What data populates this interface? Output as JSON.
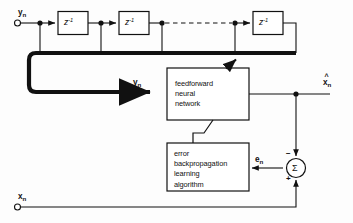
{
  "figure": {
    "type": "block-diagram",
    "background_color": "#fdfdfd",
    "line_color": "#111111"
  },
  "inputs": [
    {
      "id": "input-yn",
      "label": "y",
      "subscript": "n",
      "terminal": "open-circle",
      "position": "top-left"
    },
    {
      "id": "input-xn",
      "label": "x",
      "subscript": "n",
      "terminal": "open-circle",
      "position": "bottom-left"
    }
  ],
  "delay_line": {
    "name": "tapped-delay-line",
    "block_label": "z",
    "block_exponent": "-1",
    "block_count_shown": 3,
    "continuation": "dashed",
    "tap_count": 4
  },
  "bus": {
    "name": "delay-tap-bus",
    "style": "thick",
    "signal_label": "y",
    "signal_subscript": "n",
    "vector": true
  },
  "blocks": [
    {
      "id": "feedforward-neural-network",
      "lines": [
        "feedforward",
        "neural",
        "network"
      ],
      "has_adaptation_arrow": true
    },
    {
      "id": "error-backpropagation-learning-algorithm",
      "lines": [
        "error",
        "backpropagation",
        "learning",
        "algorithm"
      ]
    }
  ],
  "signals": [
    {
      "id": "nn-output",
      "label": "x",
      "subscript": "n",
      "hat": true
    },
    {
      "id": "error-signal",
      "label": "e",
      "subscript": "n"
    }
  ],
  "summing_junction": {
    "id": "summing-junction",
    "glyph": "Σ",
    "top_sign": "−",
    "bottom_sign": "+"
  }
}
